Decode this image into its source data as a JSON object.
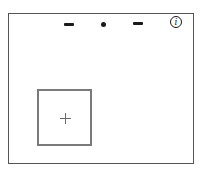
{
  "diagram": {
    "frame": {
      "border_color": "#555555"
    },
    "top_indicators": [
      {
        "type": "dash",
        "icon": "dash-icon"
      },
      {
        "type": "dot",
        "icon": "dot-icon"
      },
      {
        "type": "dash",
        "icon": "dash-icon"
      }
    ],
    "info_icon": {
      "glyph": "i",
      "icon": "info-icon"
    },
    "inner_box": {
      "border_color": "#7a7a7a",
      "center_marker": "plus-icon"
    }
  }
}
